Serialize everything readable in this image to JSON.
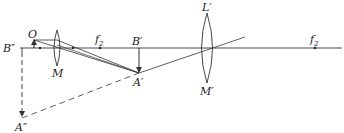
{
  "diagram": {
    "type": "optical-ray-diagram",
    "colors": {
      "line": "#333333",
      "background": "#ffffff"
    },
    "labels": {
      "object": "O",
      "lens1": "M",
      "focal_left_main": "f",
      "focal_left_sub": "2",
      "image1_base": "B′",
      "image1_tip": "A′",
      "lens2_top": "L′",
      "lens2_bottom": "M′",
      "focal_right_main": "f",
      "focal_right_sub": "2",
      "image2_base": "B″",
      "image2_tip": "A″"
    }
  }
}
